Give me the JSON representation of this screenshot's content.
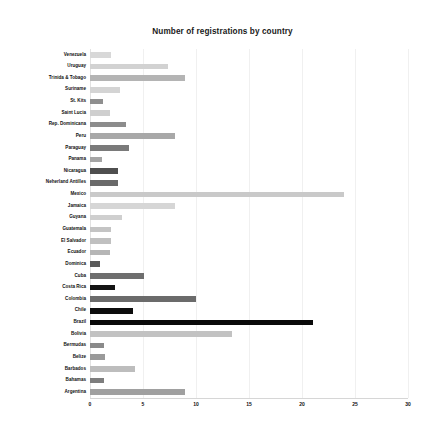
{
  "chart_data": {
    "type": "bar",
    "orientation": "horizontal",
    "title": "Number of registrations by country",
    "xlabel": "",
    "ylabel": "",
    "xlim": [
      0,
      30
    ],
    "xticks": [
      0,
      5,
      10,
      15,
      20,
      25,
      30
    ],
    "grid": true,
    "legend": false,
    "categories": [
      "Venezuela",
      "Uruguay",
      "Trinida & Tobago",
      "Suriname",
      "St. Kits",
      "Saint Lucia",
      "Rep. Dominicana",
      "Peru",
      "Paraguay",
      "Panama",
      "Nicaragua",
      "Neherland Antilles",
      "Mexico",
      "Jamaica",
      "Guyana",
      "Guatemala",
      "El Salvador",
      "Ecuador",
      "Dominica",
      "Cuba",
      "Costa Rica",
      "Colombia",
      "Chile",
      "Brazil",
      "Bolivia",
      "Bermudas",
      "Belize",
      "Barbados",
      "Bahamas",
      "Argentina"
    ],
    "values": [
      2,
      7.4,
      9,
      2.8,
      1.2,
      1.9,
      3.4,
      8,
      3.7,
      1.1,
      2.6,
      2.6,
      24,
      8,
      3,
      2,
      2,
      1.9,
      0.9,
      5.1,
      2.4,
      10,
      4.1,
      21,
      13.4,
      1.3,
      1.4,
      4.2,
      1.3,
      9
    ],
    "bar_colors": [
      "#d8d8d8",
      "#d2d2d2",
      "#b4b4b4",
      "#d4d4d4",
      "#8f8f8f",
      "#cfcfcf",
      "#8c8c8c",
      "#a8a8a8",
      "#7a7a7a",
      "#a5a5a5",
      "#4f4f4f",
      "#6a6a6a",
      "#c9c9c9",
      "#d6d6d6",
      "#cfcfcf",
      "#c4c4c4",
      "#c0c0c0",
      "#b6b6b6",
      "#5a5a5a",
      "#6e6e6e",
      "#141414",
      "#6b6b6b",
      "#0d0d0d",
      "#0a0a0a",
      "#c2c2c2",
      "#8a8a8a",
      "#9a9a9a",
      "#bdbdbd",
      "#7e7e7e",
      "#a0a0a0"
    ]
  }
}
